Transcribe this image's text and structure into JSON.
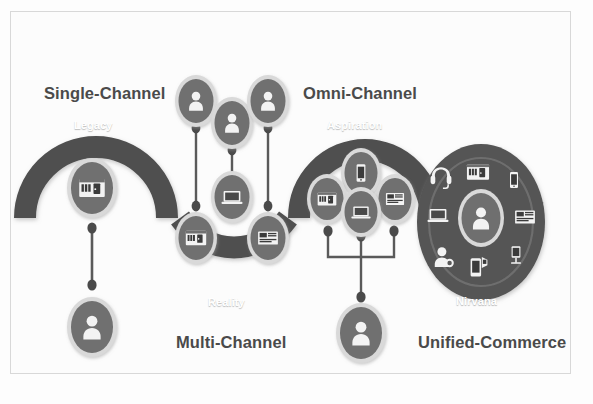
{
  "diagram": {
    "title_text": "Retail channel evolution wave",
    "colors": {
      "band": "#4f4f4f",
      "band_dark": "#464646",
      "node_fill": "#6f6f6f",
      "node_ring": "#d9d9d9",
      "icon_white": "#f2f2f2",
      "connector": "#5a5a5a",
      "title_text": "#4a4a4a",
      "inner_label_text": "#ffffff",
      "background": "#fcfcfc",
      "frame_border": "#d8d8d8"
    },
    "stage_titles": [
      {
        "id": "single-channel",
        "label": "Single-Channel",
        "x": 44,
        "y": 84
      },
      {
        "id": "omni-channel",
        "label": "Omni-Channel",
        "x": 303,
        "y": 84
      },
      {
        "id": "multi-channel",
        "label": "Multi-Channel",
        "x": 176,
        "y": 333
      },
      {
        "id": "unified-commerce",
        "label": "Unified-Commerce",
        "x": 418,
        "y": 333
      }
    ],
    "stage_inner_labels": [
      {
        "id": "legacy",
        "label": "Legacy",
        "x": 74,
        "y": 119
      },
      {
        "id": "reality",
        "label": "Reality",
        "x": 208,
        "y": 296
      },
      {
        "id": "aspiration",
        "label": "Aspiration",
        "x": 327,
        "y": 119
      },
      {
        "id": "nirvana",
        "label": "Nirvana",
        "x": 456,
        "y": 295
      }
    ],
    "nodes": [
      {
        "id": "legacy-store",
        "icon": "store-icon",
        "group": "single-channel"
      },
      {
        "id": "legacy-customer",
        "icon": "person-icon",
        "group": "single-channel"
      },
      {
        "id": "multi-customer-1",
        "icon": "person-icon",
        "group": "multi-channel"
      },
      {
        "id": "multi-customer-2",
        "icon": "person-icon",
        "group": "multi-channel"
      },
      {
        "id": "multi-customer-3",
        "icon": "person-icon",
        "group": "multi-channel"
      },
      {
        "id": "multi-store",
        "icon": "store-icon",
        "group": "multi-channel"
      },
      {
        "id": "multi-laptop",
        "icon": "laptop-icon",
        "group": "multi-channel"
      },
      {
        "id": "multi-catalog",
        "icon": "catalog-icon",
        "group": "multi-channel"
      },
      {
        "id": "omni-phone",
        "icon": "mobile-icon",
        "group": "omni-channel"
      },
      {
        "id": "omni-store",
        "icon": "store-icon",
        "group": "omni-channel"
      },
      {
        "id": "omni-catalog",
        "icon": "catalog-icon",
        "group": "omni-channel"
      },
      {
        "id": "omni-laptop",
        "icon": "laptop-icon",
        "group": "omni-channel"
      },
      {
        "id": "omni-customer",
        "icon": "person-icon",
        "group": "omni-channel"
      },
      {
        "id": "nirvana-customer",
        "icon": "person-icon",
        "group": "unified-commerce"
      }
    ],
    "nirvana_ring_icons": [
      {
        "id": "nirvana-store",
        "icon": "store-icon"
      },
      {
        "id": "nirvana-mobile",
        "icon": "mobile-icon"
      },
      {
        "id": "nirvana-catalog",
        "icon": "catalog-icon"
      },
      {
        "id": "nirvana-kiosk",
        "icon": "kiosk-icon"
      },
      {
        "id": "nirvana-scanner",
        "icon": "mobile-scan-icon"
      },
      {
        "id": "nirvana-agent",
        "icon": "support-agent-icon"
      },
      {
        "id": "nirvana-laptop",
        "icon": "laptop-icon"
      },
      {
        "id": "nirvana-headset",
        "icon": "headset-icon"
      }
    ],
    "arrow": {
      "id": "progress-arrow",
      "icon": "arrow-up-right-icon"
    }
  }
}
